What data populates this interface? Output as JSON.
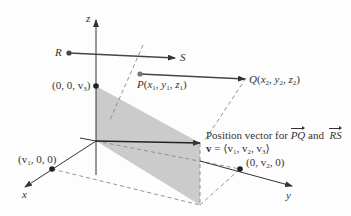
{
  "diagram": {
    "axes": {
      "x_label": "x",
      "y_label": "y",
      "z_label": "z"
    },
    "points": {
      "R": {
        "label": "R"
      },
      "S": {
        "label": "S"
      },
      "P": {
        "name": "P",
        "coords": [
          "x",
          "1",
          "y",
          "1",
          "z",
          "1"
        ]
      },
      "Q": {
        "name": "Q",
        "coords": [
          "x",
          "2",
          "y",
          "2",
          "z",
          "2"
        ]
      },
      "z_intercept": {
        "label": "(0, 0, v",
        "sub": "3",
        "close": ")"
      },
      "x_intercept": {
        "label": "(v",
        "sub": "1",
        "rest": ", 0, 0)"
      },
      "y_intercept": {
        "label": "(0, v",
        "sub": "2",
        "close": ", 0)"
      }
    },
    "annotation": {
      "line1_prefix": "Position vector for",
      "vec1": "PQ",
      "connector": "and",
      "vec2": "RS",
      "line2_bold": "v",
      "line2_rest": " = ⟨v",
      "s1": "1",
      "c1": ", v",
      "s2": "2",
      "c2": ", v",
      "s3": "3",
      "close": "⟩"
    },
    "colors": {
      "axis": "#333333",
      "vector": "#444444",
      "plane": "#c8c8c8",
      "dashed": "#888888",
      "point": "#222222",
      "point_light": "#666666"
    }
  }
}
